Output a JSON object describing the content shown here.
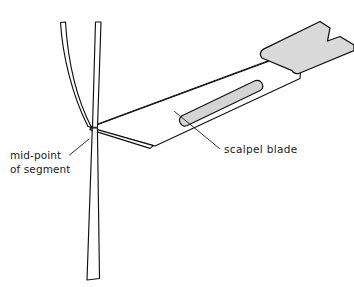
{
  "figure": {
    "background_color": "#ffffff",
    "line_color": "#111111",
    "labels": {
      "midpoint_line1": "mid-point",
      "midpoint_line2": "of segment",
      "scalpel": "scalpel  blade"
    },
    "parts": {
      "stem_upper_curved": "curved upper stem",
      "stem_upper_straight": "straight upper stem",
      "stem_lower": "lower stem",
      "blade": "scalpel blade",
      "blade_slot": "blade slot",
      "handle": "scalpel handle",
      "cut_edge": "blade cutting edge"
    },
    "colors": {
      "handle_fill": "#d9d9d9",
      "slot_fill": "#d4d4d4",
      "stroke": "#111111",
      "text": "#1a1a1a"
    }
  }
}
